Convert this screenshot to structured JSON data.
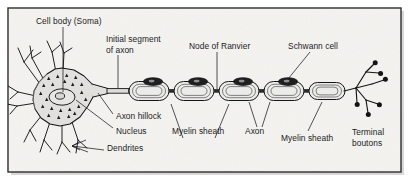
{
  "figure": {
    "background_color": "#f4f3f0",
    "border_color": "#2b2b2e",
    "ink_color": "#17171a",
    "soma_fill": "#e2e1dd",
    "myelin_fill": "#ededea",
    "nucleus_fill": "#e8e7e3",
    "schwann_nucleus_fill": "#1b1b1e"
  },
  "labels": {
    "cell_body": "Cell body (Soma)",
    "initial_segment_line1": "Initial segment",
    "initial_segment_line2": "of axon",
    "node_of_ranvier": "Node of Ranvier",
    "schwann_cell": "Schwann cell",
    "axon_hillock": "Axon hillock",
    "nucleus": "Nucleus",
    "dendrites": "Dendrites",
    "myelin_sheath_left": "Myelin sheath",
    "axon": "Axon",
    "myelin_sheath_right": "Myelin sheath",
    "terminal_boutons_line1": "Terminal",
    "terminal_boutons_line2": "boutons"
  },
  "structures": {
    "soma": "cell-body",
    "dendrites": "dendrite-branches",
    "axon_hillock": "axon-hillock-cone",
    "initial_segment": "initial-axon-segment",
    "myelin_segments_count": 5,
    "nodes_of_ranvier_count": 4,
    "schwann_nuclei_count": 5,
    "terminal_bouton_count": 6,
    "nissl_body_count": 22
  }
}
